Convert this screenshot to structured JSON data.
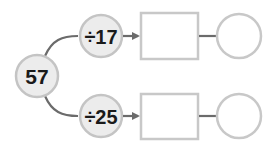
{
  "diagram": {
    "start": {
      "value": "57"
    },
    "branches": [
      {
        "operation": "÷17",
        "result_box": "",
        "remainder_circle": ""
      },
      {
        "operation": "÷25",
        "result_box": "",
        "remainder_circle": ""
      }
    ],
    "colors": {
      "node_fill": "#ececec",
      "node_stroke": "#c4c4c4",
      "connector": "#6b6b6b",
      "box_stroke": "#c8c8c8",
      "text": "#1a1a1a"
    }
  }
}
